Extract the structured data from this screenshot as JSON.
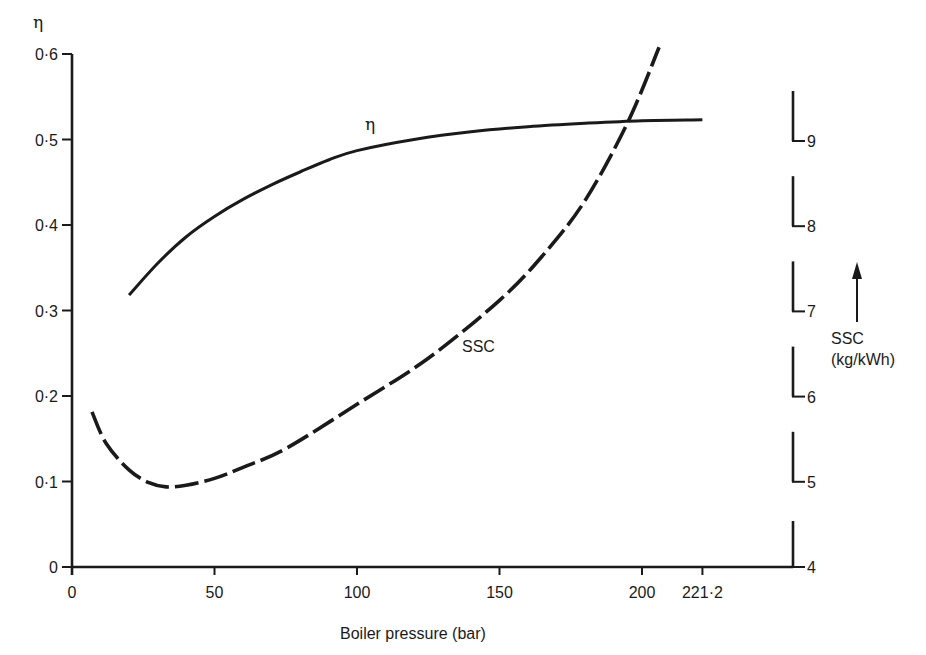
{
  "chart_data": {
    "type": "line",
    "title": "",
    "xlabel": "Boiler pressure (bar)",
    "ylabel": "η",
    "ylabel_right": "SSC (kg/kWh)",
    "xlim": [
      0,
      250
    ],
    "ylim": [
      0,
      0.6
    ],
    "ylim_right": [
      4,
      9.6
    ],
    "grid": false,
    "legend": "inline labels on curves",
    "x_ticks": [
      {
        "value": 0,
        "label": "0"
      },
      {
        "value": 50,
        "label": "50"
      },
      {
        "value": 100,
        "label": "100"
      },
      {
        "value": 150,
        "label": "150"
      },
      {
        "value": 200,
        "label": "200"
      },
      {
        "value": 221.2,
        "label": "221·2"
      }
    ],
    "y_ticks": [
      {
        "value": 0,
        "label": "0"
      },
      {
        "value": 0.1,
        "label": "0·1"
      },
      {
        "value": 0.2,
        "label": "0·2"
      },
      {
        "value": 0.3,
        "label": "0·3"
      },
      {
        "value": 0.4,
        "label": "0·4"
      },
      {
        "value": 0.5,
        "label": "0·5"
      },
      {
        "value": 0.6,
        "label": "0·6"
      }
    ],
    "y_ticks_right": [
      {
        "value": 4,
        "label": "4"
      },
      {
        "value": 5,
        "label": "5"
      },
      {
        "value": 6,
        "label": "6"
      },
      {
        "value": 7,
        "label": "7"
      },
      {
        "value": 8,
        "label": "8"
      },
      {
        "value": 9,
        "label": "9"
      }
    ],
    "series": [
      {
        "name": "η",
        "axis": "left",
        "style": "solid",
        "label": "η",
        "x": [
          20,
          30,
          40,
          50,
          60,
          70,
          80,
          90,
          100,
          120,
          140,
          160,
          180,
          200,
          221.2
        ],
        "values": [
          0.318,
          0.355,
          0.386,
          0.41,
          0.43,
          0.447,
          0.462,
          0.476,
          0.487,
          0.5,
          0.509,
          0.515,
          0.519,
          0.522,
          0.523
        ]
      },
      {
        "name": "SSC",
        "axis": "right",
        "style": "dashed",
        "label": "SSC",
        "x": [
          7,
          12,
          20,
          27,
          33,
          40,
          50,
          60,
          75,
          100,
          125,
          150,
          165,
          180,
          195,
          206
        ],
        "values": [
          5.82,
          5.45,
          5.14,
          4.99,
          4.94,
          4.96,
          5.04,
          5.17,
          5.39,
          5.91,
          6.45,
          7.13,
          7.65,
          8.3,
          9.22,
          10.1
        ]
      }
    ],
    "annotations": [
      {
        "text": "η",
        "near": "η curve at ~100 bar"
      },
      {
        "text": "SSC",
        "near": "SSC curve at ~140 bar"
      },
      {
        "text": "↑ SSC (kg/kWh)",
        "near": "right axis"
      }
    ]
  },
  "labels": {
    "y_left_title": "η",
    "x_title": "Boiler pressure (bar)",
    "right_title_line1": "SSC",
    "right_title_line2": "(kg/kWh)",
    "eta_curve_label": "η",
    "ssc_curve_label": "SSC"
  },
  "colors": {
    "ink": "#1a1a1a",
    "background": "#ffffff"
  }
}
